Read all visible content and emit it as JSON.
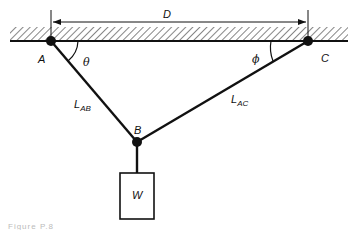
{
  "diagram": {
    "type": "two-cable-suspended-weight",
    "labels": {
      "dimension": "D",
      "point_a": "A",
      "point_b": "B",
      "point_c": "C",
      "angle_a": "θ",
      "angle_c": "ϕ",
      "cable_ab": {
        "main": "L",
        "sub": "AB"
      },
      "cable_ac": {
        "main": "L",
        "sub": "AC"
      },
      "weight": "W"
    },
    "caption": "Figure P.8"
  },
  "colors": {
    "ink": "#111111",
    "background": "#ffffff"
  }
}
